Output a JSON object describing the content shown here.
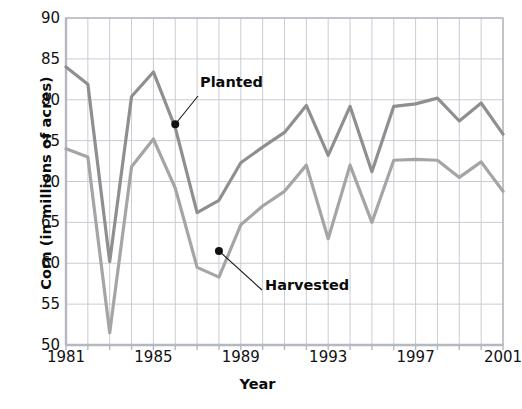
{
  "chart_data": {
    "type": "line",
    "title": "",
    "xlabel": "Year",
    "ylabel": "Corn (in millions of acres)",
    "xlim": [
      1981,
      2001
    ],
    "ylim": [
      50,
      90
    ],
    "ytick_labels": [
      "90",
      "85",
      "80",
      "75",
      "70",
      "65",
      "60",
      "55",
      "50"
    ],
    "ytick_values": [
      90,
      85,
      80,
      75,
      70,
      65,
      60,
      55,
      50
    ],
    "xtick_labels": [
      "1981",
      "1985",
      "1989",
      "1993",
      "1997",
      "2001"
    ],
    "xtick_values": [
      1981,
      1985,
      1989,
      1993,
      1997,
      2001
    ],
    "grid": true,
    "legend": "annotated-inline",
    "x": [
      1981,
      1982,
      1983,
      1984,
      1985,
      1986,
      1987,
      1988,
      1989,
      1990,
      1991,
      1992,
      1993,
      1994,
      1995,
      1996,
      1997,
      1998,
      1999,
      2000,
      2001
    ],
    "series": [
      {
        "name": "Planted",
        "color": "#8f8f8f",
        "values": [
          84.0,
          81.9,
          60.2,
          80.4,
          83.4,
          76.6,
          66.2,
          67.7,
          72.3,
          74.2,
          76.0,
          79.3,
          73.2,
          79.2,
          71.2,
          79.2,
          79.5,
          80.2,
          77.4,
          79.6,
          75.8
        ],
        "annotation": {
          "label": "Planted",
          "point_year": 1986,
          "point_value": 77.0
        }
      },
      {
        "name": "Harvested",
        "color": "#a5a5a5",
        "values": [
          74.0,
          73.0,
          51.5,
          71.8,
          75.2,
          69.2,
          59.5,
          58.3,
          64.7,
          67.0,
          68.8,
          72.0,
          63.0,
          72.0,
          65.0,
          72.6,
          72.7,
          72.6,
          70.5,
          72.4,
          68.8
        ],
        "annotation": {
          "label": "Harvested",
          "point_year": 1988,
          "point_value": 61.5
        }
      }
    ]
  }
}
